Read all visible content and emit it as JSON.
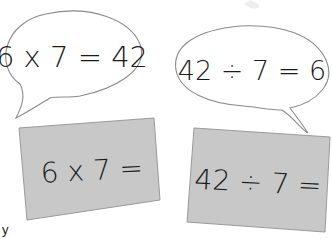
{
  "colors": {
    "background": "#ffffff",
    "bubble_stroke": "#8a8a8a",
    "card_fill": "#c8c8c8",
    "card_stroke": "#9a9a9a",
    "ink": "#1a1a1a"
  },
  "bubbles": [
    {
      "id": "left",
      "equation": "6 x 7 = 42"
    },
    {
      "id": "right",
      "equation": "42 ÷ 7 = 6"
    }
  ],
  "cards": [
    {
      "id": "left",
      "prompt": "6 x 7 ="
    },
    {
      "id": "right",
      "prompt": "42 ÷ 7 ="
    }
  ],
  "edge_text": "y"
}
